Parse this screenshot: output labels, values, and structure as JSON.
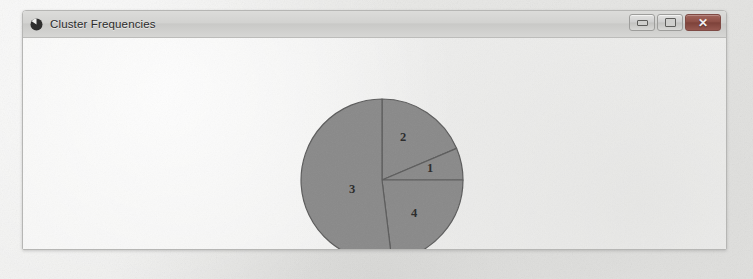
{
  "window": {
    "title": "Cluster Frequencies",
    "icon": "pie-chart-icon",
    "controls": {
      "minimize_label": "–",
      "maximize_label": "□",
      "close_label": "✕"
    }
  },
  "colors": {
    "slice_fill": "#8a8a8a",
    "slice_stroke": "#5c5c5c",
    "titlebar_top": "#dcdcda",
    "titlebar_bottom": "#d6d6d4",
    "client_bg": "#f4f4f3",
    "close_button": "#8d4f46",
    "page_bg": "#ececeb",
    "label_text": "#2a2a2a"
  },
  "chart_data": {
    "type": "pie",
    "title": "Cluster Frequencies",
    "xlabel": "",
    "ylabel": "",
    "legend": "none",
    "grid": false,
    "start_angle_deg": 0,
    "direction": "clockwise",
    "center": {
      "x": 359,
      "y": 142
    },
    "radius": 81,
    "categories": [
      "1",
      "2",
      "3",
      "4"
    ],
    "values": [
      6.4,
      18.6,
      51.9,
      23.1
    ],
    "slices": [
      {
        "label": "2",
        "percent": 18.6,
        "start_deg": 0,
        "end_deg": 67,
        "label_x": 380,
        "label_y": 100,
        "fill": "#8a8a8a"
      },
      {
        "label": "1",
        "percent": 6.4,
        "start_deg": 67,
        "end_deg": 90,
        "label_x": 407,
        "label_y": 131,
        "fill": "#8a8a8a"
      },
      {
        "label": "4",
        "percent": 23.1,
        "start_deg": 90,
        "end_deg": 173,
        "label_x": 391,
        "label_y": 176,
        "fill": "#8a8a8a"
      },
      {
        "label": "3",
        "percent": 51.9,
        "start_deg": 173,
        "end_deg": 360,
        "label_x": 329,
        "label_y": 152,
        "fill": "#8a8a8a"
      }
    ]
  },
  "page": {
    "ghost_marks": [
      {
        "text": "",
        "x": 120,
        "y": 185
      },
      {
        "text": "",
        "x": 600,
        "y": 160
      },
      {
        "text": "",
        "x": 430,
        "y": 262
      }
    ]
  }
}
